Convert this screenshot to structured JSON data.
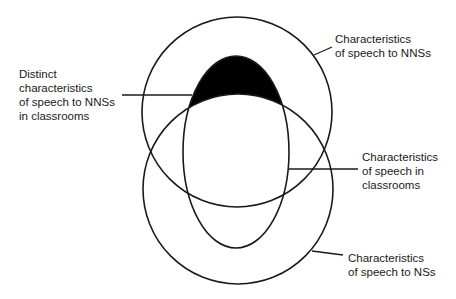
{
  "diagram": {
    "type": "venn",
    "shapes": [
      {
        "id": "speech-to-nnss",
        "shape": "circle"
      },
      {
        "id": "speech-to-nss",
        "shape": "circle"
      },
      {
        "id": "speech-in-classrooms",
        "shape": "ellipse"
      }
    ],
    "highlighted_region": "speech-to-nnss AND speech-in-classrooms NOT speech-to-nss",
    "highlight_color": "#000000",
    "labels": {
      "distinct": "Distinct\ncharacteristics\nof speech to NNSs\nin classrooms",
      "nnss": "Characteristics\nof speech to NNSs",
      "classrooms": "Characteristics\nof speech in\nclassrooms",
      "nss": "Characteristics\nof speech to NSs"
    }
  }
}
